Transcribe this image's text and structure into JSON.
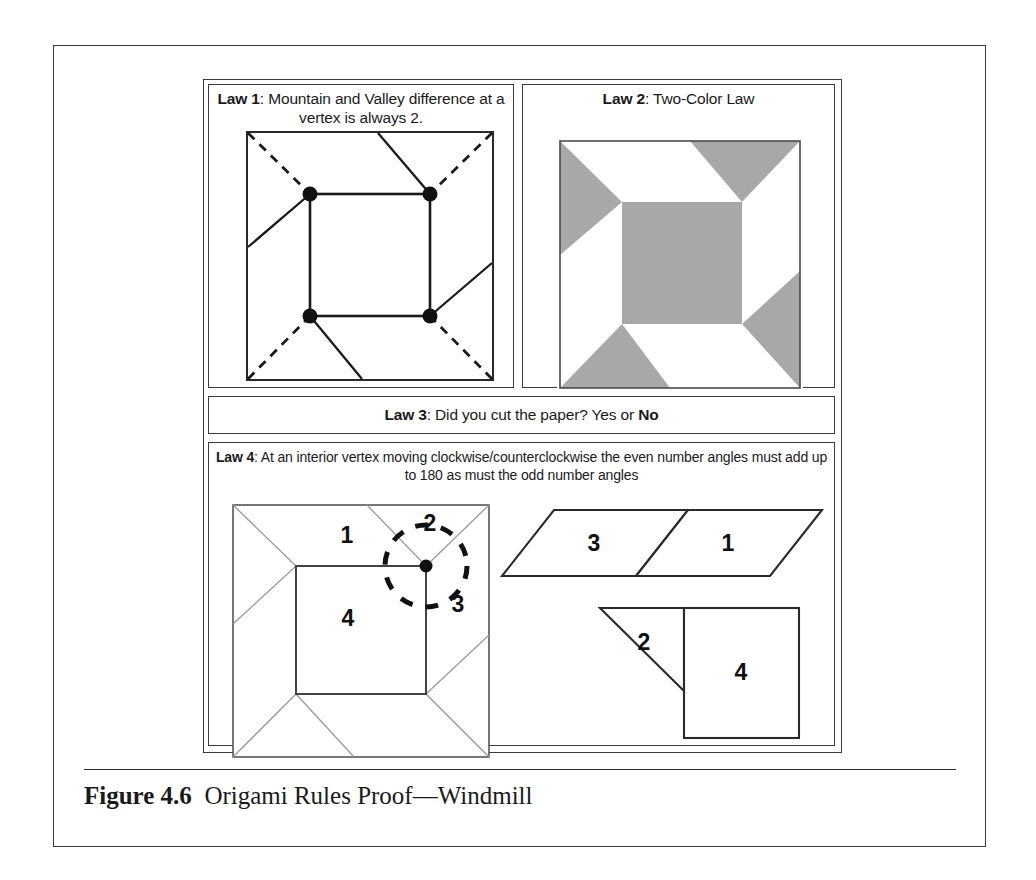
{
  "figure": {
    "caption_label": "Figure 4.6",
    "caption_text": "Origami Rules Proof—Windmill"
  },
  "laws": {
    "law1": {
      "label": "Law 1",
      "separator": ": ",
      "text": "Mountain and Valley difference at a vertex is always 2."
    },
    "law2": {
      "label": "Law 2",
      "separator": ": ",
      "text": "Two-Color Law"
    },
    "law3": {
      "label": "Law 3",
      "separator": ": ",
      "text": "Did you cut the paper?  Yes or ",
      "answer": "No"
    },
    "law4": {
      "label": "Law 4",
      "separator": ": ",
      "text": "At an interior vertex moving clockwise/counterclockwise the even number angles must add up to 180 as must the odd number angles"
    }
  },
  "law4_diagram": {
    "angle_labels": [
      "1",
      "2",
      "3",
      "4"
    ],
    "unfolded_top": {
      "left_label": "3",
      "right_label": "1"
    },
    "unfolded_bottom": {
      "triangle_label": "2",
      "square_label": "4"
    }
  },
  "colors": {
    "ink": "#2a2a2a",
    "gray_fill": "#a8a8a8",
    "thin_line": "#7a7a7a",
    "page_bg": "#ffffff"
  }
}
